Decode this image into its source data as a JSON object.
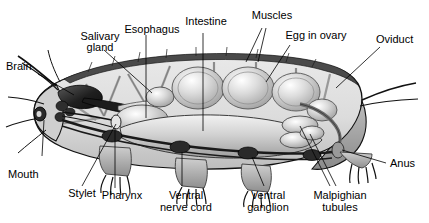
{
  "figure": {
    "background_color": "#ffffff",
    "line_color": "#000000",
    "body_fill": "#d8d8d8",
    "organ_fill": "#c4c4c4",
    "cuticle_color": "#4a4a4a",
    "dark_organ_color": "#2b2b2b"
  },
  "labels": {
    "brain": "Brain",
    "salivary_gland_line1": "Salivary",
    "salivary_gland_line2": "gland",
    "esophagus": "Esophagus",
    "intestine": "Intestine",
    "muscles": "Muscles",
    "egg_in_ovary": "Egg in ovary",
    "oviduct": "Oviduct",
    "mouth": "Mouth",
    "stylet": "Stylet",
    "pharynx": "Pharynx",
    "ventral_nerve_cord_line1": "Ventral",
    "ventral_nerve_cord_line2": "nerve cord",
    "ventral_ganglion_line1": "Ventral",
    "ventral_ganglion_line2": "ganglion",
    "malpighian_tubules_line1": "Malpighian",
    "malpighian_tubules_line2": "tubules",
    "anus": "Anus"
  }
}
